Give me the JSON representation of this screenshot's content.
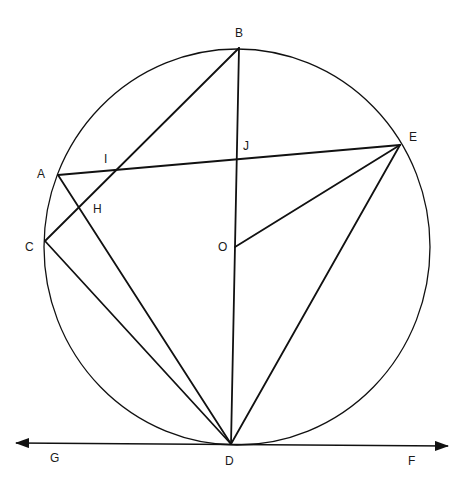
{
  "figure": {
    "type": "circle geometry diagram",
    "circle": {
      "center": "O",
      "cx": 237,
      "cy": 247,
      "rx": 193,
      "ry": 198
    },
    "points": [
      {
        "id": "B",
        "label": "B",
        "x": 239,
        "y": 48,
        "lx": 239,
        "ly": 36
      },
      {
        "id": "E",
        "label": "E",
        "x": 400,
        "y": 145,
        "lx": 414,
        "ly": 140
      },
      {
        "id": "A",
        "label": "A",
        "x": 58,
        "y": 175,
        "lx": 42,
        "ly": 177
      },
      {
        "id": "C",
        "label": "C",
        "x": 45,
        "y": 241,
        "lx": 30,
        "ly": 250
      },
      {
        "id": "D",
        "label": "D",
        "x": 231,
        "y": 444,
        "lx": 229,
        "ly": 464
      },
      {
        "id": "O",
        "label": "O",
        "x": 235,
        "y": 247,
        "lx": 223,
        "ly": 250
      },
      {
        "id": "J",
        "label": "J",
        "x": 237,
        "y": 158,
        "lx": 247,
        "ly": 149
      },
      {
        "id": "I",
        "label": "I",
        "x": 116,
        "y": 170,
        "lx": 106,
        "ly": 162
      },
      {
        "id": "H",
        "label": "H",
        "x": 79,
        "y": 208,
        "lx": 98,
        "ly": 212
      },
      {
        "id": "G",
        "label": "G",
        "x": 54,
        "y": 457,
        "lx": 54,
        "ly": 461
      },
      {
        "id": "F",
        "label": "F",
        "x": 412,
        "y": 460,
        "lx": 412,
        "ly": 464
      }
    ],
    "segments": [
      {
        "name": "BC",
        "from": "B",
        "to": "C"
      },
      {
        "name": "BD",
        "from": "B",
        "to": "D"
      },
      {
        "name": "AE",
        "from": "A",
        "to": "E"
      },
      {
        "name": "AD",
        "from": "A",
        "to": "D"
      },
      {
        "name": "CD",
        "from": "C",
        "to": "D"
      },
      {
        "name": "OE",
        "from": "O",
        "to": "E"
      },
      {
        "name": "ED",
        "from": "E",
        "to": "D"
      }
    ],
    "tangent_line": {
      "name": "GF",
      "through": "D",
      "x1": 14,
      "y1": 443,
      "x2": 450,
      "y2": 446,
      "arrows": "both"
    },
    "labels": {
      "A": "A",
      "B": "B",
      "C": "C",
      "D": "D",
      "E": "E",
      "F": "F",
      "G": "G",
      "H": "H",
      "I": "I",
      "J": "J",
      "O": "O"
    },
    "colors": {
      "stroke": "#111111",
      "background": "#ffffff",
      "text": "#1a1a1a"
    }
  }
}
